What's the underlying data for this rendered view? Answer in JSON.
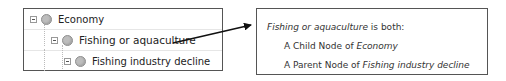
{
  "tree": {
    "nodes": [
      {
        "label": "Economy",
        "level": 0,
        "expanded": true,
        "icon": "node-circle-icon"
      },
      {
        "label": "Fishing or aquaculture",
        "level": 1,
        "expanded": true,
        "icon": "node-circle-icon"
      },
      {
        "label": "Fishing industry decline",
        "level": 2,
        "expanded": true,
        "icon": "node-circle-icon"
      }
    ]
  },
  "callout": {
    "subject": "Fishing or aquaculture",
    "subject_suffix": " is both:",
    "line2_prefix": "A Child Node of ",
    "line2_target": "Economy",
    "line3_prefix": "A Parent Node of ",
    "line3_target": "Fishing industry decline"
  },
  "colors": {
    "border": "#555555",
    "node_fill": "#bdbdbd",
    "arrow": "#111111"
  }
}
